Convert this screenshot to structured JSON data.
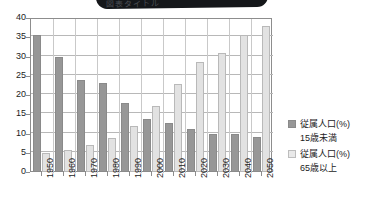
{
  "banner": {
    "text": "図表タイトル"
  },
  "chart_data": {
    "type": "bar",
    "title": "",
    "subtitle": "",
    "xlabel": "",
    "ylabel": "",
    "ylim": [
      0,
      40
    ],
    "ytick_step": 5,
    "yticks": [
      "0",
      "5",
      "10",
      "15",
      "20",
      "25",
      "30",
      "35",
      "40"
    ],
    "grid": true,
    "legend_position": "right",
    "categories": [
      "1950",
      "1960",
      "1970",
      "1980",
      "1990",
      "2000",
      "2010",
      "2020",
      "2030",
      "2040",
      "2050"
    ],
    "series": [
      {
        "name": "従属人口(%)",
        "name_line2": "15歳未満",
        "color": "#979797",
        "values": [
          35.5,
          29.8,
          24.0,
          23.2,
          17.8,
          13.7,
          12.8,
          11.2,
          9.9,
          9.9,
          9.1
        ]
      },
      {
        "name": "従属人口(%)",
        "name_line2": "65歳以上",
        "color": "#e2e2e2",
        "values": [
          4.9,
          5.6,
          7.1,
          8.9,
          12.0,
          17.1,
          22.9,
          28.5,
          31.0,
          35.5,
          38.0
        ]
      }
    ]
  },
  "legend": {
    "items": [
      {
        "label": "従属人口(%)",
        "sublabel": "15歳未満",
        "swatch": "dark"
      },
      {
        "label": "従属人口(%)",
        "sublabel": "65歳以上",
        "swatch": "light"
      }
    ]
  }
}
